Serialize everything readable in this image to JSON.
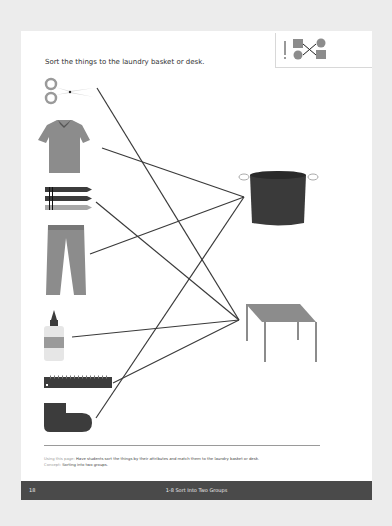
{
  "page": {
    "instruction": "Sort the things to the laundry basket or desk.",
    "activity_icon": "matching-lines-icon",
    "items_left": [
      {
        "name": "scissors",
        "icon": "scissors-icon",
        "group": "desk"
      },
      {
        "name": "shirt",
        "icon": "shirt-icon",
        "group": "laundry basket"
      },
      {
        "name": "crayons",
        "icon": "crayons-icon",
        "group": "desk"
      },
      {
        "name": "pants",
        "icon": "pants-icon",
        "group": "laundry basket"
      },
      {
        "name": "glue",
        "icon": "glue-bottle-icon",
        "group": "desk"
      },
      {
        "name": "ruler",
        "icon": "ruler-icon",
        "group": "desk"
      },
      {
        "name": "sock",
        "icon": "sock-icon",
        "group": "laundry basket"
      }
    ],
    "targets_right": [
      {
        "name": "laundry basket",
        "icon": "laundry-basket-icon"
      },
      {
        "name": "desk",
        "icon": "desk-icon"
      }
    ],
    "colors": {
      "line": "#3a3a3a",
      "dark_item": "#3c3c3c",
      "gray_item": "#8c8c8c",
      "footer_bar": "#4a4a4a"
    }
  },
  "notes": {
    "using_label": "Using this page:",
    "using_text": "Have students sort the things by their attributes and match them to the laundry basket or desk.",
    "concept_label": "Concept:",
    "concept_text": "Sorting into two groups."
  },
  "footer": {
    "page_number": "18",
    "title": "1-8  Sort Into Two Groups"
  }
}
